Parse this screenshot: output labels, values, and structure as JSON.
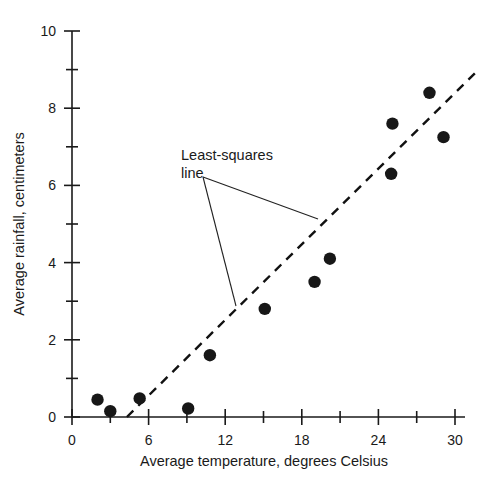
{
  "chart_data": {
    "type": "scatter",
    "title": "",
    "xlabel": "Average temperature, degrees Celsius",
    "ylabel": "Average rainfall, centimeters",
    "xlim": [
      0,
      30
    ],
    "ylim": [
      0,
      10
    ],
    "grid": false,
    "legend": "none",
    "x_major_ticks": [
      0,
      6,
      12,
      18,
      24,
      30
    ],
    "x_minor_ticks": [
      3,
      9,
      15,
      21,
      27
    ],
    "y_major_ticks": [
      0,
      2,
      4,
      6,
      8,
      10
    ],
    "y_minor_ticks": [
      1,
      3,
      5,
      7,
      9
    ],
    "x_tick_labels": [
      "0",
      "6",
      "12",
      "18",
      "24",
      "30"
    ],
    "y_tick_labels": [
      "0",
      "2",
      "4",
      "6",
      "8",
      "10"
    ],
    "points": [
      {
        "x": 2.0,
        "y": 0.45
      },
      {
        "x": 3.0,
        "y": 0.15
      },
      {
        "x": 5.3,
        "y": 0.48
      },
      {
        "x": 9.1,
        "y": 0.22
      },
      {
        "x": 10.8,
        "y": 1.6
      },
      {
        "x": 15.1,
        "y": 2.8
      },
      {
        "x": 19.0,
        "y": 3.5
      },
      {
        "x": 20.2,
        "y": 4.1
      },
      {
        "x": 25.0,
        "y": 6.3
      },
      {
        "x": 25.1,
        "y": 7.6
      },
      {
        "x": 28.0,
        "y": 8.4
      },
      {
        "x": 29.1,
        "y": 7.25
      }
    ],
    "marker": {
      "shape": "circle",
      "color": "#171717",
      "size_px": 6.2
    },
    "fit_line": {
      "style": "dashed",
      "color": "#111111",
      "x_start": 4.3,
      "y_start": 0.0,
      "x_end": 31.7,
      "y_end": 8.95
    },
    "annotations": [
      {
        "text_line_1": "Least-squares",
        "text_line_2": "line",
        "text_x_px": 181,
        "text_y_px": 160,
        "leaders": [
          {
            "from_x_px": 203,
            "from_y_px": 177,
            "to_x_px": 318,
            "to_y_px": 219
          },
          {
            "from_x_px": 203,
            "from_y_px": 177,
            "to_x_px": 236,
            "to_y_px": 306
          }
        ]
      }
    ]
  },
  "axes": {
    "x_title": "Average temperature, degrees Celsius",
    "y_title": "Average rainfall, centimeters"
  },
  "annotation": {
    "label_line1": "Least-squares",
    "label_line2": "line"
  },
  "colors": {
    "background": "#ffffff",
    "axis": "#1a1a1a",
    "marker": "#171717",
    "fit_line": "#111111",
    "text": "#1a1a1a"
  }
}
